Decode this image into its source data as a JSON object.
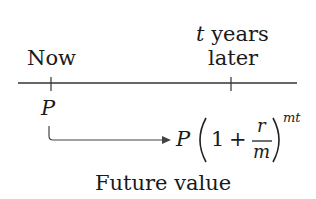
{
  "timeline": {
    "start_label": "Now",
    "end_label_line1_var": "t",
    "end_label_line1_rest": " years",
    "end_label_line2": "later"
  },
  "present": {
    "symbol": "P"
  },
  "future": {
    "P": "P",
    "one": "1",
    "plus": "+",
    "numerator": "r",
    "denominator": "m",
    "exponent": "mt",
    "caption": "Future value"
  }
}
